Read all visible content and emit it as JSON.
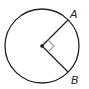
{
  "diagram": {
    "type": "circle-with-radii",
    "circle": {
      "cx": 42,
      "cy": 46,
      "r": 37,
      "stroke": "#222222"
    },
    "center_point": {
      "x": 42,
      "y": 46
    },
    "points": [
      {
        "label": "A",
        "x": 68,
        "y": 20,
        "label_x": 71,
        "label_y": 18
      },
      {
        "label": "B",
        "x": 68,
        "y": 72,
        "label_x": 71,
        "label_y": 83
      }
    ],
    "right_angle_marker": {
      "color": "#999999",
      "at": "center",
      "between": [
        "A",
        "B"
      ]
    },
    "labels": {
      "a": "A",
      "b": "B"
    }
  }
}
